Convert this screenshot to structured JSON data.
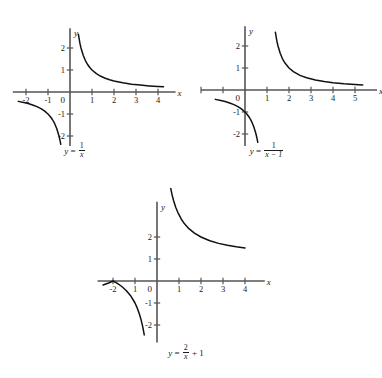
{
  "page": {
    "background": "#ffffff",
    "ink": "#1a1a1a",
    "axis_color": "#555555",
    "curve_color": "#111111",
    "width": 382,
    "height": 378
  },
  "chart_data": [
    {
      "type": "line",
      "id": "graph-1",
      "title": "y = 1/x",
      "caption_parts": {
        "lhs": "y",
        "equals": "=",
        "numerator": "1",
        "denominator": "x"
      },
      "xlabel": "x",
      "ylabel": "y",
      "xlim": [
        -2.6,
        4.8
      ],
      "ylim": [
        -2.7,
        2.9
      ],
      "xticks": [
        -2,
        -1,
        1,
        2,
        3,
        4
      ],
      "xtick_labels": [
        "-2",
        "-1",
        "1",
        "2",
        "3",
        "4"
      ],
      "yticks": [
        -2,
        -1,
        1,
        2
      ],
      "ytick_labels": [
        "-2",
        "-1",
        "1",
        "2"
      ],
      "origin_label": "0",
      "grid": false,
      "legend": "none",
      "series": [
        {
          "name": "right branch",
          "x": [
            0.38,
            0.45,
            0.5,
            0.6,
            0.7,
            0.8,
            0.9,
            1.0,
            1.2,
            1.4,
            1.6,
            1.8,
            2.0,
            2.4,
            2.8,
            3.2,
            3.6,
            4.0,
            4.25
          ],
          "y": [
            2.63,
            2.22,
            2.0,
            1.667,
            1.429,
            1.25,
            1.111,
            1.0,
            0.833,
            0.714,
            0.625,
            0.556,
            0.5,
            0.417,
            0.357,
            0.313,
            0.278,
            0.25,
            0.235
          ]
        },
        {
          "name": "left branch",
          "x": [
            -2.35,
            -2.1,
            -1.9,
            -1.7,
            -1.5,
            -1.3,
            -1.15,
            -1.0,
            -0.9,
            -0.8,
            -0.7,
            -0.6,
            -0.5,
            -0.44,
            -0.42
          ],
          "y": [
            -0.426,
            -0.476,
            -0.526,
            -0.588,
            -0.667,
            -0.769,
            -0.87,
            -1.0,
            -1.111,
            -1.25,
            -1.429,
            -1.667,
            -2.0,
            -2.27,
            -2.38
          ]
        }
      ]
    },
    {
      "type": "line",
      "id": "graph-2",
      "title": "y = 1/(x - 1)",
      "caption_parts": {
        "lhs": "y",
        "equals": "=",
        "numerator": "1",
        "denominator": "x − 1"
      },
      "xlabel": "x",
      "ylabel": "y",
      "xlim": [
        -2.0,
        6.0
      ],
      "ylim": [
        -2.9,
        2.9
      ],
      "xticks": [
        -2,
        -1,
        1,
        2,
        3,
        4,
        5
      ],
      "xtick_labels": [
        "",
        "",
        "1",
        "2",
        "3",
        "4",
        "5"
      ],
      "yticks": [
        -2,
        -1,
        1,
        2
      ],
      "ytick_labels": [
        "-2",
        "-1",
        "1",
        "2"
      ],
      "origin_label": "0",
      "grid": false,
      "legend": "none",
      "series": [
        {
          "name": "right branch",
          "x": [
            1.38,
            1.45,
            1.5,
            1.6,
            1.7,
            1.8,
            2.0,
            2.2,
            2.5,
            2.8,
            3.2,
            3.6,
            4.0,
            4.5,
            5.0,
            5.35
          ],
          "y": [
            2.63,
            2.22,
            2.0,
            1.667,
            1.429,
            1.25,
            1.0,
            0.833,
            0.667,
            0.556,
            0.455,
            0.385,
            0.333,
            0.286,
            0.25,
            0.23
          ]
        },
        {
          "name": "left branch",
          "x": [
            -1.35,
            -1.1,
            -0.9,
            -0.7,
            -0.5,
            -0.3,
            -0.15,
            0.0,
            0.1,
            0.2,
            0.3,
            0.4,
            0.5,
            0.56,
            0.58
          ],
          "y": [
            -0.426,
            -0.476,
            -0.526,
            -0.588,
            -0.667,
            -0.769,
            -0.87,
            -1.0,
            -1.111,
            -1.25,
            -1.429,
            -1.667,
            -2.0,
            -2.27,
            -2.38
          ]
        }
      ]
    },
    {
      "type": "line",
      "id": "graph-3",
      "title": "y = 2/x + 1",
      "caption_parts": {
        "lhs": "y",
        "equals": "=",
        "numerator": "2",
        "denominator": "x",
        "tail": "+ 1"
      },
      "xlabel": "x",
      "ylabel": "y",
      "xlim": [
        -2.7,
        4.9
      ],
      "ylim": [
        -2.8,
        3.6
      ],
      "xticks": [
        -2,
        -1,
        1,
        2,
        3,
        4
      ],
      "xtick_labels": [
        "-2",
        "1",
        "1",
        "2",
        "3",
        "4"
      ],
      "yticks": [
        -2,
        -1,
        1,
        2
      ],
      "ytick_labels": [
        "-2",
        "-1",
        "1",
        "2"
      ],
      "origin_label": "0",
      "grid": false,
      "legend": "none",
      "series": [
        {
          "name": "right branch",
          "x": [
            0.62,
            0.68,
            0.75,
            0.85,
            0.95,
            1.1,
            1.25,
            1.45,
            1.7,
            2.0,
            2.4,
            2.8,
            3.2,
            3.6,
            4.0
          ],
          "y": [
            4.23,
            3.94,
            3.67,
            3.35,
            3.11,
            2.82,
            2.6,
            2.38,
            2.18,
            2.0,
            1.83,
            1.71,
            1.625,
            1.556,
            1.5
          ]
        },
        {
          "name": "left branch",
          "x": [
            -2.45,
            -2.2,
            -2.0,
            -1.8,
            -1.6,
            -1.4,
            -1.2,
            -1.0,
            -0.9,
            -0.8,
            -0.72,
            -0.65,
            -0.6,
            -0.58
          ],
          "y": [
            -0.184,
            -0.091,
            0.0,
            -0.111,
            -0.25,
            -0.429,
            -0.667,
            -1.0,
            -1.222,
            -1.5,
            -1.778,
            -2.077,
            -2.333,
            -2.45
          ]
        }
      ]
    }
  ]
}
